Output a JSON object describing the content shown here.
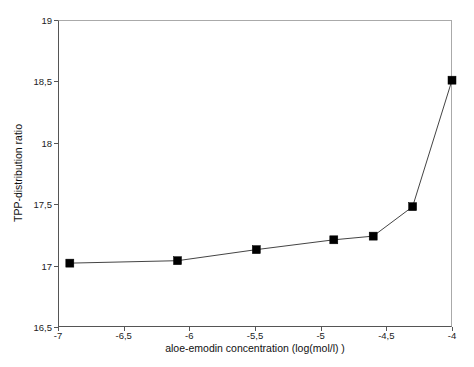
{
  "chart_data": {
    "type": "line",
    "title": "",
    "xlabel": "aloe-emodin concentration (log(mol/l) )",
    "ylabel": "TPP-distribution ratio",
    "xlim": [
      -7,
      -4
    ],
    "ylim": [
      16.5,
      19
    ],
    "grid": false,
    "legend": null,
    "legend_position": "none",
    "marker": "filled-square",
    "line_color": "#444444",
    "marker_color": "#000000",
    "x_ticks": [
      -7,
      -6.5,
      -6,
      -5.5,
      -5,
      -4.5,
      -4
    ],
    "x_tick_labels": [
      "-7",
      "-6,5",
      "-6",
      "-5,5",
      "-5",
      "-4,5",
      "-4"
    ],
    "y_ticks": [
      16.5,
      17,
      17.5,
      18,
      18.5,
      19
    ],
    "y_tick_labels": [
      "16,5",
      "17",
      "17,5",
      "18",
      "18,5",
      "19"
    ],
    "series": [
      {
        "name": "TPP-distribution ratio",
        "x": [
          -6.91,
          -6.09,
          -5.49,
          -4.9,
          -4.6,
          -4.3,
          -4.0
        ],
        "values": [
          17.02,
          17.04,
          17.13,
          17.21,
          17.24,
          17.48,
          18.51
        ]
      }
    ]
  }
}
